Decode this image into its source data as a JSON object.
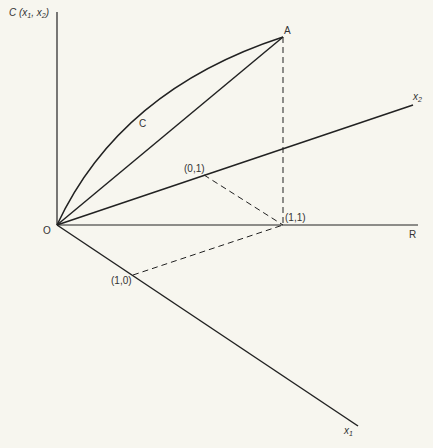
{
  "diagram": {
    "labels": {
      "cost_axis": "C (x",
      "cost_axis_sub1": "1",
      "cost_axis_mid": ", x",
      "cost_axis_sub2": "2",
      "cost_axis_end": ")",
      "origin": "O",
      "point_a": "A",
      "curve_c": "C",
      "axis_r": "R",
      "point_11": "(1,1)",
      "point_01": "(0,1)",
      "point_10": "(1,0)",
      "axis_x1": "x",
      "axis_x1_sub": "1",
      "axis_x2": "x",
      "axis_x2_sub": "2"
    },
    "colors": {
      "line": "#222222",
      "background": "#f7f6ef",
      "text": "#333333"
    }
  }
}
